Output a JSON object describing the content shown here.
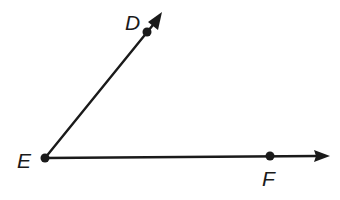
{
  "figure": {
    "type": "angle",
    "name": "angle DEF",
    "vertex": "E",
    "rays": [
      {
        "name": "ray ED",
        "from": "E",
        "through": "D",
        "direction": "up-right"
      },
      {
        "name": "ray EF",
        "from": "E",
        "through": "F",
        "direction": "right"
      }
    ]
  },
  "points": {
    "D": {
      "label": "D"
    },
    "E": {
      "label": "E"
    },
    "F": {
      "label": "F"
    }
  },
  "colors": {
    "ink": "#1a1a1a",
    "background": "#ffffff"
  }
}
